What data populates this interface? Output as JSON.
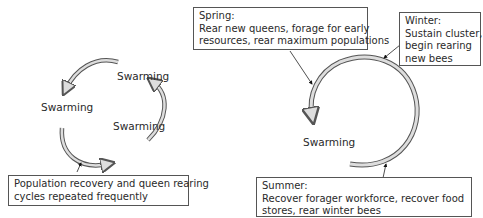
{
  "left_cycle": {
    "swarm_labels": [
      "Swarming",
      "Swarming",
      "Swarming"
    ],
    "note_lines": [
      "Population recovery and queen rearing",
      "cycles repeated frequently"
    ]
  },
  "right_cycle": {
    "swarm_label": "Swarming",
    "spring": {
      "title": "Spring:",
      "lines": [
        "Rear new queens, forage for early",
        "resources, rear maximum populations"
      ]
    },
    "winter": {
      "title": "Winter:",
      "lines": [
        "Sustain cluster,",
        "begin rearing",
        "new bees"
      ]
    },
    "summer": {
      "title": "Summer:",
      "lines": [
        "Recover forager workforce, recover food",
        "stores, rear winter bees"
      ]
    }
  },
  "colors": {
    "arrow_fill": "#d8d8d8",
    "arrow_stroke": "#555555",
    "box_border": "#555555"
  }
}
